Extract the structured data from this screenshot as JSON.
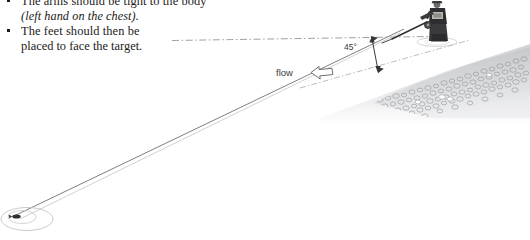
{
  "page": {
    "background_color": "#ffffff",
    "width": 530,
    "height": 240
  },
  "instructions": {
    "bullets": [
      {
        "marker": "square-bullet",
        "lines": [
          {
            "text": "The arms should be tight to the body",
            "style": "roman",
            "clipped_top": true
          },
          {
            "text": "(left hand on the chest).",
            "style": "italic"
          }
        ]
      },
      {
        "marker": "square-bullet",
        "lines": [
          {
            "text": "The feet should then be",
            "style": "roman"
          },
          {
            "text": "placed to face the target.",
            "style": "roman"
          }
        ]
      }
    ]
  },
  "figure": {
    "angle_label": "45°",
    "flow_label": "flow",
    "flow_arrow_direction": "left",
    "elements": {
      "angler": "angler-figure",
      "rod": "fishing-rod",
      "cast_line": "cast-line",
      "target": "target-ellipse",
      "lure": "lure-marker",
      "bank": "gravel-bank",
      "horizontal_reference": "dash-dot-reference-line",
      "water_edge": "dash-dot-water-line",
      "angle_arrow": "double-headed-angle-arrow"
    },
    "colors": {
      "line": "#6f6f6f",
      "reference_line": "#9a9a9a",
      "gravel": "#8e8e90",
      "angler_dark": "#2e2d30",
      "water_shade": "#d9dadd",
      "text": "#3b3b3b"
    }
  }
}
